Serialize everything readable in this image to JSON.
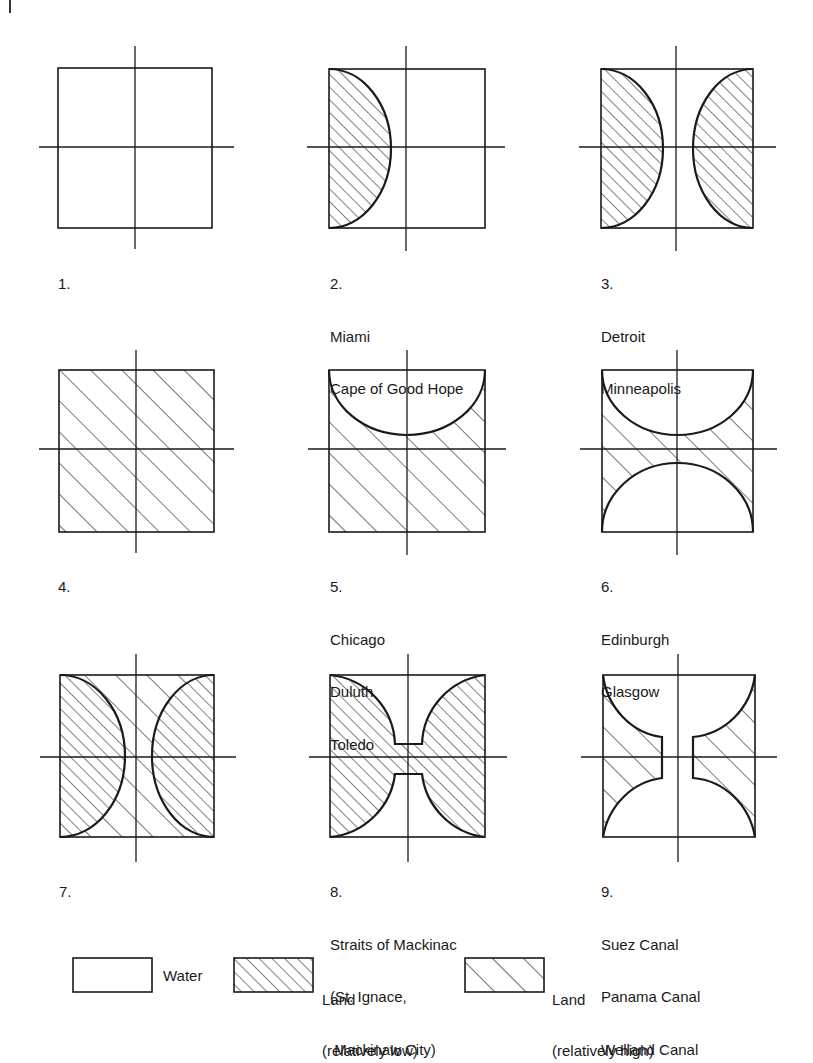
{
  "figure": {
    "colors": {
      "ink": "#1a1a1a",
      "paper": "#ffffff"
    },
    "panels": [
      {
        "number": "1.",
        "places": []
      },
      {
        "number": "2.",
        "places": [
          "Miami",
          "Cape of Good Hope"
        ]
      },
      {
        "number": "3.",
        "places": [
          "Detroit",
          "Minneapolis"
        ]
      },
      {
        "number": "4.",
        "places": []
      },
      {
        "number": "5.",
        "places": [
          "Chicago",
          "Duluth",
          "Toledo"
        ]
      },
      {
        "number": "6.",
        "places": [
          "Edinburgh",
          "Glasgow"
        ]
      },
      {
        "number": "7.",
        "places": []
      },
      {
        "number": "8.",
        "places": [
          "Straits of Mackinac",
          "(St. Ignace,",
          " Mackinaw City)"
        ]
      },
      {
        "number": "9.",
        "places": [
          "Suez Canal",
          "Panama Canal",
          "Welland Canal"
        ]
      }
    ],
    "legend": {
      "water": {
        "label": "Water"
      },
      "land_low": {
        "line1": "Land",
        "line2": "(relatively low)"
      },
      "land_high": {
        "line1": "Land",
        "line2": "(relatively high)"
      }
    }
  }
}
